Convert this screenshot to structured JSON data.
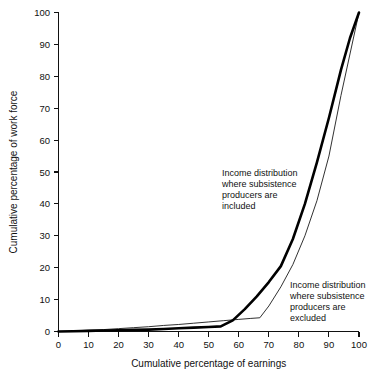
{
  "chart_data": {
    "type": "line",
    "title": "",
    "subtitle": "",
    "xlabel": "Cumulative percentage of earnings",
    "ylabel": "Cumulative percentage of work force",
    "xlim": [
      0,
      100
    ],
    "ylim": [
      0,
      100
    ],
    "xticks": [
      0,
      10,
      20,
      30,
      40,
      50,
      60,
      70,
      80,
      90,
      100
    ],
    "yticks": [
      0,
      10,
      20,
      30,
      40,
      50,
      60,
      70,
      80,
      90,
      100
    ],
    "xtick_labels": [
      "0",
      "10",
      "20",
      "30",
      "40",
      "50",
      "60",
      "70",
      "80",
      "90",
      "100"
    ],
    "ytick_labels": [
      "0",
      "10",
      "20",
      "30",
      "40",
      "50",
      "60",
      "70",
      "80",
      "90",
      "100"
    ],
    "grid": false,
    "legend": "annotations-inline",
    "series": [
      {
        "name": "Income distribution where subsistence producers are included",
        "style": "thick",
        "x": [
          0,
          5,
          10,
          15,
          20,
          25,
          30,
          35,
          40,
          45,
          50,
          54,
          58,
          62,
          66,
          70,
          74,
          78,
          82,
          86,
          90,
          94,
          97,
          100
        ],
        "values": [
          0,
          0.1,
          0.2,
          0.3,
          0.4,
          0.5,
          0.6,
          0.8,
          1.0,
          1.2,
          1.4,
          1.6,
          3.5,
          7.0,
          11.0,
          15.5,
          20.5,
          29.0,
          40.0,
          53.0,
          67.0,
          82.0,
          92.0,
          100
        ]
      },
      {
        "name": "Income distribution where subsistence producers are excluded",
        "style": "thin",
        "x": [
          0,
          5,
          10,
          15,
          20,
          25,
          30,
          35,
          40,
          45,
          50,
          55,
          60,
          64,
          67,
          70,
          74,
          78,
          82,
          86,
          90,
          94,
          97,
          100
        ],
        "values": [
          0,
          0.2,
          0.4,
          0.6,
          0.9,
          1.2,
          1.5,
          1.9,
          2.2,
          2.6,
          3.0,
          3.4,
          3.8,
          4.1,
          4.3,
          8.0,
          14.0,
          21.0,
          30.0,
          41.0,
          55.0,
          74.0,
          87.0,
          100
        ]
      }
    ],
    "annotations": [
      {
        "id": "annotation-included",
        "lines": [
          "Income distribution",
          "where subsistence",
          "producers are",
          "included"
        ]
      },
      {
        "id": "annotation-excluded",
        "lines": [
          "Income distribution",
          "where subsistence",
          "producers are",
          "excluded"
        ]
      }
    ],
    "colors": {
      "axis": "#111111",
      "curve_included": "#000000",
      "curve_excluded": "#1a1a1a",
      "background": "#ffffff"
    }
  }
}
